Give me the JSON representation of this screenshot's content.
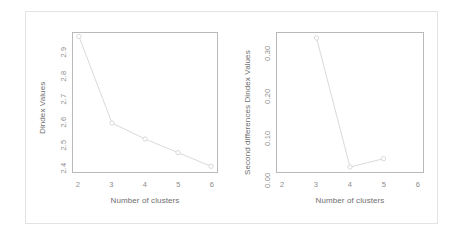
{
  "figure": {
    "background_color": "#ffffff",
    "frame_color": "#e3e3e3",
    "axis_color": "#b9b9b9",
    "series_color": "#d8d8d8",
    "tick_text_color": "#8d8d8d",
    "label_text_color": "#6e6e6e"
  },
  "chart_data": [
    {
      "type": "line",
      "panel": "left",
      "title": "",
      "xlabel": "Number of clusters",
      "ylabel": "Dindex Values",
      "x": [
        2,
        3,
        4,
        5,
        6
      ],
      "values": [
        2.93,
        2.55,
        2.48,
        2.42,
        2.36
      ],
      "xticks": [
        "2",
        "3",
        "4",
        "5",
        "6"
      ],
      "xtick_values": [
        2,
        3,
        4,
        5,
        6
      ],
      "yticks": [
        "2.9",
        "2.8",
        "2.7",
        "2.6",
        "2.5",
        "2.4"
      ],
      "ytick_values": [
        2.9,
        2.8,
        2.7,
        2.6,
        2.5,
        2.4
      ],
      "xlim": [
        1.82,
        6.18
      ],
      "ylim": [
        2.335,
        2.945
      ],
      "grid": false,
      "legend": null,
      "marker": "open-circle",
      "line_style": "solid"
    },
    {
      "type": "line",
      "panel": "right",
      "title": "",
      "xlabel": "Number of clusters",
      "ylabel": "Second differences Dindex Values",
      "x": [
        3,
        4,
        5
      ],
      "values": [
        0.31,
        0.0,
        0.02
      ],
      "xticks": [
        "2",
        "3",
        "4",
        "5",
        "6"
      ],
      "xtick_values": [
        2,
        3,
        4,
        5,
        6
      ],
      "yticks": [
        "0.30",
        "0.20",
        "0.10",
        "0.00"
      ],
      "ytick_values": [
        0.3,
        0.2,
        0.1,
        0.0
      ],
      "xlim": [
        1.82,
        6.18
      ],
      "ylim": [
        -0.012,
        0.322
      ],
      "grid": false,
      "legend": null,
      "marker": "open-circle",
      "line_style": "solid"
    }
  ]
}
